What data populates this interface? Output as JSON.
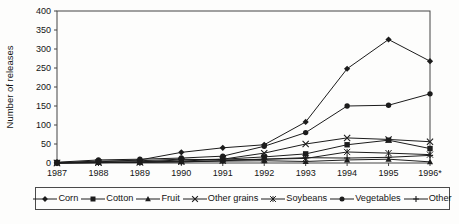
{
  "figure": {
    "kind": "scanned line chart",
    "background": "#fdfdfc",
    "line_color": "#1c1c1c",
    "axis_color": "#444444"
  },
  "chart_data": {
    "type": "line",
    "title": "",
    "xlabel": "",
    "ylabel": "Number of releases",
    "ylim": [
      0,
      400
    ],
    "ytick_step": 50,
    "grid": false,
    "legend_position": "bottom",
    "categories": [
      "1987",
      "1988",
      "1989",
      "1990",
      "1991",
      "1992",
      "1993",
      "1994",
      "1995",
      "1996*"
    ],
    "series": [
      {
        "name": "Corn",
        "marker": "diamond",
        "values": [
          0,
          3,
          8,
          28,
          40,
          48,
          108,
          248,
          325,
          268
        ]
      },
      {
        "name": "Cotton",
        "marker": "square",
        "values": [
          1,
          2,
          3,
          8,
          10,
          16,
          24,
          48,
          60,
          38
        ]
      },
      {
        "name": "Fruit",
        "marker": "triangle",
        "values": [
          0,
          1,
          2,
          3,
          5,
          6,
          4,
          8,
          10,
          3
        ]
      },
      {
        "name": "Other grains",
        "marker": "x",
        "values": [
          0,
          1,
          2,
          5,
          10,
          26,
          50,
          66,
          62,
          56
        ]
      },
      {
        "name": "Soybeans",
        "marker": "asterisk",
        "values": [
          0,
          1,
          2,
          3,
          6,
          10,
          12,
          29,
          26,
          22
        ]
      },
      {
        "name": "Vegetables",
        "marker": "circle",
        "values": [
          2,
          8,
          10,
          13,
          18,
          44,
          80,
          150,
          152,
          182
        ]
      },
      {
        "name": "Other",
        "marker": "plus",
        "values": [
          1,
          5,
          6,
          10,
          8,
          10,
          14,
          13,
          15,
          20
        ]
      }
    ]
  }
}
